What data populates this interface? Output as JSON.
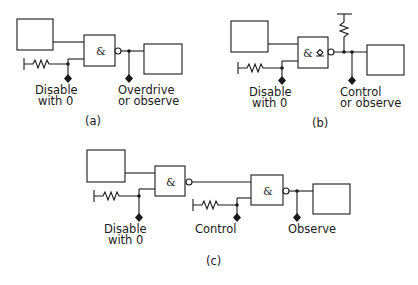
{
  "panels": {
    "a": {
      "caption": "(a)",
      "gate_symbol": "&",
      "input_label_line1": "Disable",
      "input_label_line2": "with 0",
      "output_label_line1": "Overdrive",
      "output_label_line2": "or observe"
    },
    "b": {
      "caption": "(b)",
      "gate_symbol": "&",
      "open_collector_symbol": "◇",
      "input_label_line1": "Disable",
      "input_label_line2": "with 0",
      "output_label_line1": "Control",
      "output_label_line2": "or observe"
    },
    "c": {
      "caption": "(c)",
      "gate1_symbol": "&",
      "gate2_symbol": "&",
      "input_label_line1": "Disable",
      "input_label_line2": "with 0",
      "control_label": "Control",
      "output_label": "Observe"
    }
  },
  "icons": {
    "gate": "nand-gate-icon",
    "resistor": "resistor-icon",
    "test_point": "diamond-test-point-icon",
    "junction": "junction-dot-icon"
  }
}
